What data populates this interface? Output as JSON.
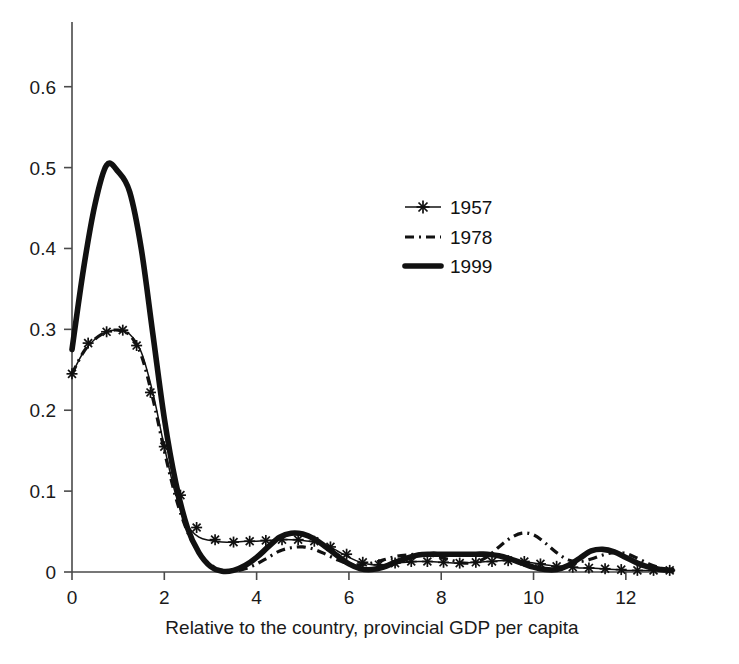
{
  "chart_data": {
    "type": "line",
    "title": "",
    "subtitle": "",
    "xlabel": "Relative to the country, provincial GDP per capita",
    "ylabel": "",
    "xlim": [
      0,
      13
    ],
    "ylim": [
      0,
      0.68
    ],
    "grid": false,
    "legend_position": "upper-center-right",
    "xticks": [
      "0",
      "2",
      "4",
      "6",
      "8",
      "10",
      "12"
    ],
    "xtick_values": [
      0,
      2,
      4,
      6,
      8,
      10,
      12
    ],
    "yticks": [
      "0",
      "0.1",
      "0.2",
      "0.3",
      "0.4",
      "0.5",
      "0.6"
    ],
    "ytick_values": [
      0,
      0.1,
      0.2,
      0.3,
      0.4,
      0.5,
      0.6
    ],
    "x": [
      0,
      0.25,
      0.5,
      0.75,
      1.0,
      1.25,
      1.5,
      1.75,
      2.0,
      2.25,
      2.5,
      2.75,
      3.0,
      3.25,
      3.5,
      3.75,
      4.0,
      4.25,
      4.5,
      4.75,
      5.0,
      5.25,
      5.5,
      5.75,
      6.0,
      6.25,
      6.5,
      6.75,
      7.0,
      7.25,
      7.5,
      7.75,
      8.0,
      8.25,
      8.5,
      8.75,
      9.0,
      9.25,
      9.5,
      9.75,
      10.0,
      10.25,
      10.5,
      10.75,
      11.0,
      11.25,
      11.5,
      11.75,
      12.0,
      12.25,
      12.5,
      12.75,
      13.0
    ],
    "series": [
      {
        "name": "1957",
        "style": "thin-line-with-plus-markers",
        "values": [
          0.245,
          0.272,
          0.288,
          0.297,
          0.299,
          0.294,
          0.272,
          0.222,
          0.155,
          0.095,
          0.058,
          0.043,
          0.039,
          0.037,
          0.037,
          0.038,
          0.038,
          0.039,
          0.04,
          0.04,
          0.039,
          0.037,
          0.033,
          0.026,
          0.018,
          0.012,
          0.009,
          0.009,
          0.011,
          0.012,
          0.013,
          0.013,
          0.012,
          0.011,
          0.011,
          0.012,
          0.013,
          0.014,
          0.014,
          0.013,
          0.011,
          0.009,
          0.007,
          0.006,
          0.005,
          0.005,
          0.004,
          0.003,
          0.002,
          0.002,
          0.002,
          0.002,
          0.002
        ]
      },
      {
        "name": "1978",
        "style": "dash-dot-line",
        "values": [
          0.245,
          0.272,
          0.288,
          0.297,
          0.299,
          0.293,
          0.268,
          0.215,
          0.15,
          0.092,
          0.05,
          0.024,
          0.009,
          0.002,
          0.001,
          0.004,
          0.01,
          0.018,
          0.026,
          0.03,
          0.031,
          0.028,
          0.022,
          0.015,
          0.01,
          0.009,
          0.011,
          0.015,
          0.019,
          0.021,
          0.022,
          0.021,
          0.018,
          0.014,
          0.011,
          0.012,
          0.019,
          0.031,
          0.042,
          0.048,
          0.046,
          0.036,
          0.024,
          0.015,
          0.013,
          0.016,
          0.021,
          0.024,
          0.023,
          0.017,
          0.01,
          0.005,
          0.002
        ]
      },
      {
        "name": "1999",
        "style": "thick-solid-line",
        "values": [
          0.275,
          0.375,
          0.455,
          0.503,
          0.495,
          0.47,
          0.4,
          0.295,
          0.19,
          0.11,
          0.055,
          0.024,
          0.007,
          0.001,
          0.002,
          0.008,
          0.018,
          0.031,
          0.043,
          0.048,
          0.047,
          0.041,
          0.031,
          0.02,
          0.01,
          0.004,
          0.003,
          0.006,
          0.012,
          0.017,
          0.021,
          0.022,
          0.022,
          0.022,
          0.022,
          0.022,
          0.022,
          0.02,
          0.016,
          0.011,
          0.006,
          0.003,
          0.003,
          0.008,
          0.017,
          0.026,
          0.028,
          0.025,
          0.018,
          0.011,
          0.006,
          0.003,
          0.002
        ]
      }
    ],
    "marker_x_1957": [
      0.0,
      0.35,
      0.75,
      1.1,
      1.4,
      1.7,
      2.0,
      2.35,
      2.7,
      3.1,
      3.5,
      3.85,
      4.2,
      4.55,
      4.9,
      5.25,
      5.6,
      5.95,
      6.3,
      6.65,
      7.0,
      7.35,
      7.7,
      8.05,
      8.4,
      8.75,
      9.1,
      9.45,
      9.8,
      10.15,
      10.5,
      10.85,
      11.2,
      11.55,
      11.9,
      12.25,
      12.6,
      12.95
    ],
    "marker_y_1957": [
      0.245,
      0.283,
      0.297,
      0.299,
      0.28,
      0.222,
      0.155,
      0.095,
      0.055,
      0.04,
      0.037,
      0.038,
      0.039,
      0.04,
      0.04,
      0.038,
      0.031,
      0.022,
      0.012,
      0.009,
      0.011,
      0.013,
      0.013,
      0.012,
      0.011,
      0.012,
      0.013,
      0.014,
      0.013,
      0.01,
      0.007,
      0.006,
      0.005,
      0.004,
      0.003,
      0.002,
      0.002,
      0.002
    ]
  },
  "legend": {
    "entries": [
      {
        "label": "1957",
        "marker": "plus-marker-line"
      },
      {
        "label": "1978",
        "marker": "dash-dot-line"
      },
      {
        "label": "1999",
        "marker": "thick-solid-line"
      }
    ]
  },
  "axes": {
    "x_title": "Relative to the country, provincial GDP per capita"
  }
}
